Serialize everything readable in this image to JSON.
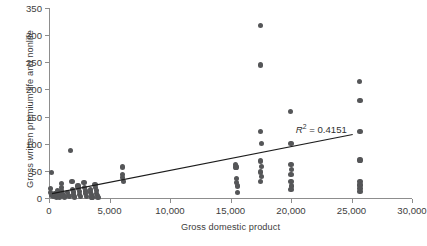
{
  "chart_data": {
    "type": "scatter",
    "title": "",
    "xlabel": "Gross domestic product",
    "ylabel": "Gross written premium life and nonlife",
    "xlim": [
      0,
      30000
    ],
    "ylim": [
      0,
      350
    ],
    "xticks": [
      0,
      5000,
      10000,
      15000,
      20000,
      25000,
      30000
    ],
    "xticklabels": [
      "0",
      "5,000",
      "10,000",
      "15,000",
      "20,000",
      "25,000",
      "30,000"
    ],
    "yticks": [
      0,
      50,
      100,
      150,
      200,
      250,
      300,
      350
    ],
    "yticklabels": [
      "0",
      "50",
      "100",
      "150",
      "200",
      "250",
      "300",
      "350"
    ],
    "grid": false,
    "legend": null,
    "marker_color": "#555658",
    "annotations": [
      {
        "name": "r-squared",
        "text": "R² = 0.4151",
        "prefix": "R",
        "sup": "2",
        "suffix": " = 0.4151",
        "x": 20400,
        "y": 128
      }
    ],
    "trendline": {
      "type": "linear",
      "color": "#1c1c1c",
      "x_start": 250,
      "y_start": 8,
      "x_end": 25100,
      "y_end": 117
    },
    "points": [
      {
        "x": 200,
        "y": 47
      },
      {
        "x": 1800,
        "y": 88
      },
      {
        "x": 150,
        "y": 18
      },
      {
        "x": 150,
        "y": 10
      },
      {
        "x": 200,
        "y": 5
      },
      {
        "x": 400,
        "y": 3
      },
      {
        "x": 500,
        "y": 8
      },
      {
        "x": 600,
        "y": 2
      },
      {
        "x": 700,
        "y": 13
      },
      {
        "x": 750,
        "y": 6
      },
      {
        "x": 850,
        "y": 2
      },
      {
        "x": 1000,
        "y": 26
      },
      {
        "x": 1000,
        "y": 20
      },
      {
        "x": 1050,
        "y": 14
      },
      {
        "x": 1100,
        "y": 9
      },
      {
        "x": 1150,
        "y": 4
      },
      {
        "x": 1300,
        "y": 2
      },
      {
        "x": 1500,
        "y": 10
      },
      {
        "x": 1600,
        "y": 4
      },
      {
        "x": 1700,
        "y": 3
      },
      {
        "x": 1900,
        "y": 30
      },
      {
        "x": 1950,
        "y": 16
      },
      {
        "x": 2000,
        "y": 11
      },
      {
        "x": 2050,
        "y": 6
      },
      {
        "x": 2100,
        "y": 2
      },
      {
        "x": 2400,
        "y": 22
      },
      {
        "x": 2450,
        "y": 17
      },
      {
        "x": 2500,
        "y": 12
      },
      {
        "x": 2550,
        "y": 7
      },
      {
        "x": 2600,
        "y": 3
      },
      {
        "x": 2900,
        "y": 28
      },
      {
        "x": 2950,
        "y": 20
      },
      {
        "x": 3000,
        "y": 13
      },
      {
        "x": 3050,
        "y": 8
      },
      {
        "x": 3100,
        "y": 3
      },
      {
        "x": 3400,
        "y": 16
      },
      {
        "x": 3450,
        "y": 11
      },
      {
        "x": 3500,
        "y": 6
      },
      {
        "x": 3550,
        "y": 2
      },
      {
        "x": 3800,
        "y": 25
      },
      {
        "x": 3850,
        "y": 19
      },
      {
        "x": 3900,
        "y": 14
      },
      {
        "x": 3950,
        "y": 9
      },
      {
        "x": 4000,
        "y": 4
      },
      {
        "x": 4050,
        "y": 1
      },
      {
        "x": 6050,
        "y": 57
      },
      {
        "x": 6100,
        "y": 44
      },
      {
        "x": 6100,
        "y": 38
      },
      {
        "x": 6150,
        "y": 31
      },
      {
        "x": 15400,
        "y": 62
      },
      {
        "x": 15450,
        "y": 57
      },
      {
        "x": 15500,
        "y": 36
      },
      {
        "x": 15500,
        "y": 29
      },
      {
        "x": 15550,
        "y": 22
      },
      {
        "x": 15600,
        "y": 10
      },
      {
        "x": 17450,
        "y": 318
      },
      {
        "x": 17500,
        "y": 245
      },
      {
        "x": 17500,
        "y": 122
      },
      {
        "x": 17550,
        "y": 100
      },
      {
        "x": 17500,
        "y": 68
      },
      {
        "x": 17550,
        "y": 58
      },
      {
        "x": 17500,
        "y": 48
      },
      {
        "x": 17550,
        "y": 40
      },
      {
        "x": 17500,
        "y": 31
      },
      {
        "x": 19950,
        "y": 160
      },
      {
        "x": 20000,
        "y": 100
      },
      {
        "x": 20000,
        "y": 62
      },
      {
        "x": 20050,
        "y": 52
      },
      {
        "x": 20000,
        "y": 44
      },
      {
        "x": 20000,
        "y": 30
      },
      {
        "x": 20050,
        "y": 22
      },
      {
        "x": 20000,
        "y": 15
      },
      {
        "x": 25650,
        "y": 215
      },
      {
        "x": 25700,
        "y": 180
      },
      {
        "x": 25700,
        "y": 122
      },
      {
        "x": 25700,
        "y": 70
      },
      {
        "x": 25700,
        "y": 30
      },
      {
        "x": 25700,
        "y": 24
      },
      {
        "x": 25700,
        "y": 18
      },
      {
        "x": 25700,
        "y": 12
      }
    ]
  }
}
